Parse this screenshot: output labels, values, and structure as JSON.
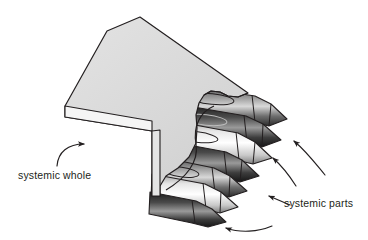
{
  "figure": {
    "background_color": "#ffffff",
    "type": "conceptual illustration"
  },
  "labels": {
    "whole": "systemic whole",
    "parts": "systemic parts"
  },
  "colors": {
    "outline": "#231f20",
    "box_top": "#d9d9d9",
    "box_edge": "#f2f2f2",
    "box_side": "#cfcfcf",
    "crayon_dark": "#3a3a3a",
    "crayon_mid": "#7c7c7c",
    "crayon_light": "#e8e8e8",
    "crayon_darkest": "#1f1f1f",
    "text": "#231f20",
    "arrow": "#231f20"
  },
  "annotations": {
    "whole_arrow": {
      "name": "arrow-to-box",
      "points_to": "box lower-left edge"
    },
    "parts_arrows": [
      {
        "name": "arrow-to-upper-crayon-tip",
        "points_to": "upper crayon tip"
      },
      {
        "name": "arrow-to-middle-crayon-tip",
        "points_to": "middle crayon tip"
      },
      {
        "name": "arrow-to-lower-crayon-tip",
        "points_to": "lower crayon tip"
      },
      {
        "name": "arrow-to-bottom-crayon-tip",
        "points_to": "bottom crayon tip"
      }
    ]
  },
  "shapes": {
    "box": {
      "name": "crayon-box",
      "top_face": "M 107,31 L 140,17 L 248,93 L 214,106 Z",
      "torn_front": "M 214,106 L 248,93 L 250,135 L 221,163 L 200,177 L 198,196 L 160,196 L 160,122 Z",
      "left_edge_top": "M 65,106 L 107,31 L 214,106 L 160,122 Z",
      "left_edge_side": "M 65,106 L 160,122 L 160,133 L 65,117 Z",
      "front_lip": "M 160,133 L 160,196 L 152,196 L 152,131 Z"
    },
    "crayons": [
      {
        "name": "crayon-top-rear",
        "tone": "mid"
      },
      {
        "name": "crayon-top-front",
        "tone": "dark"
      },
      {
        "name": "crayon-middle-rear",
        "tone": "light"
      },
      {
        "name": "crayon-middle-front",
        "tone": "dark"
      },
      {
        "name": "crayon-bottom-rear",
        "tone": "mid"
      },
      {
        "name": "crayon-bottom-front",
        "tone": "light"
      }
    ]
  }
}
